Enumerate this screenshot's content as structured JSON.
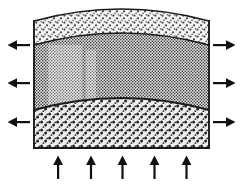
{
  "figure": {
    "canvas": {
      "width": 243,
      "height": 187
    },
    "background_color": "#ffffff",
    "outline_color": "#1a1a1a",
    "arrow_color": "#111111"
  },
  "block": {
    "name": "layered-block",
    "left_edge_x": 34,
    "right_edge_x": 209,
    "base_y": 148,
    "crest_y": 6,
    "edge_top_y": 21,
    "description": "Three stacked strata with arched (folded) upper boundaries and a flat base"
  },
  "layers": [
    {
      "id": "layer-top",
      "label": "top layer",
      "texture": "coarse-stipple-light",
      "fill_color": "#f2f2f2",
      "dot_color": "#4d4d4d",
      "top_boundary": "outer-arch",
      "bottom_boundary": "interface-upper",
      "center_thickness": 24,
      "edge_thickness": 24
    },
    {
      "id": "layer-middle",
      "label": "middle layer",
      "texture": "fine-halftone-dots",
      "fill_color": "#dcdcdc",
      "dot_color": "#333333",
      "top_boundary": "interface-upper",
      "bottom_boundary": "interface-lower",
      "center_thickness": 67,
      "edge_thickness": 65
    },
    {
      "id": "layer-bottom",
      "label": "bottom layer",
      "texture": "coarse-speckle",
      "fill_color": "#ededed",
      "dot_color": "#2b2b2b",
      "top_boundary": "interface-lower",
      "bottom_boundary": "flat-base",
      "center_thickness": 51,
      "edge_thickness": 38
    }
  ],
  "boundaries": [
    {
      "id": "outer-arch",
      "name": "top-surface-arch",
      "shape": "arch",
      "left_y": 21,
      "crest_y": 6,
      "right_y": 21,
      "line_width": 1.4
    },
    {
      "id": "interface-upper",
      "name": "upper-layer-interface",
      "shape": "arch",
      "left_y": 45,
      "crest_y": 30,
      "right_y": 45,
      "line_width": 1.4
    },
    {
      "id": "interface-lower",
      "name": "lower-layer-interface",
      "shape": "arch",
      "left_y": 110,
      "crest_y": 97,
      "right_y": 110,
      "line_width": 1.6
    },
    {
      "id": "flat-base",
      "name": "base-line",
      "shape": "straight",
      "left_y": 148,
      "right_y": 148,
      "line_width": 1.6
    }
  ],
  "arrows": {
    "left_group": {
      "name": "left-extension-arrows",
      "direction": "left",
      "count": 3,
      "meaning": "outward pull / extension",
      "items": [
        {
          "id": "arrow-left-1",
          "tail_x": 30,
          "head_x": 8,
          "y": 45
        },
        {
          "id": "arrow-left-2",
          "tail_x": 30,
          "head_x": 8,
          "y": 83
        },
        {
          "id": "arrow-left-3",
          "tail_x": 30,
          "head_x": 8,
          "y": 122
        }
      ]
    },
    "right_group": {
      "name": "right-extension-arrows",
      "direction": "right",
      "count": 3,
      "meaning": "outward pull / extension",
      "items": [
        {
          "id": "arrow-right-1",
          "tail_x": 213,
          "head_x": 235,
          "y": 45
        },
        {
          "id": "arrow-right-2",
          "tail_x": 213,
          "head_x": 235,
          "y": 83
        },
        {
          "id": "arrow-right-3",
          "tail_x": 213,
          "head_x": 235,
          "y": 122
        }
      ]
    },
    "bottom_group": {
      "name": "basal-uplift-arrows",
      "direction": "up",
      "count": 5,
      "meaning": "upward force from below",
      "items": [
        {
          "id": "arrow-up-1",
          "x": 58,
          "tail_y": 180,
          "head_y": 156
        },
        {
          "id": "arrow-up-2",
          "x": 91,
          "tail_y": 180,
          "head_y": 156
        },
        {
          "id": "arrow-up-3",
          "x": 122,
          "tail_y": 180,
          "head_y": 156
        },
        {
          "id": "arrow-up-4",
          "x": 154,
          "tail_y": 180,
          "head_y": 156
        },
        {
          "id": "arrow-up-5",
          "x": 186,
          "tail_y": 180,
          "head_y": 156
        }
      ]
    }
  }
}
